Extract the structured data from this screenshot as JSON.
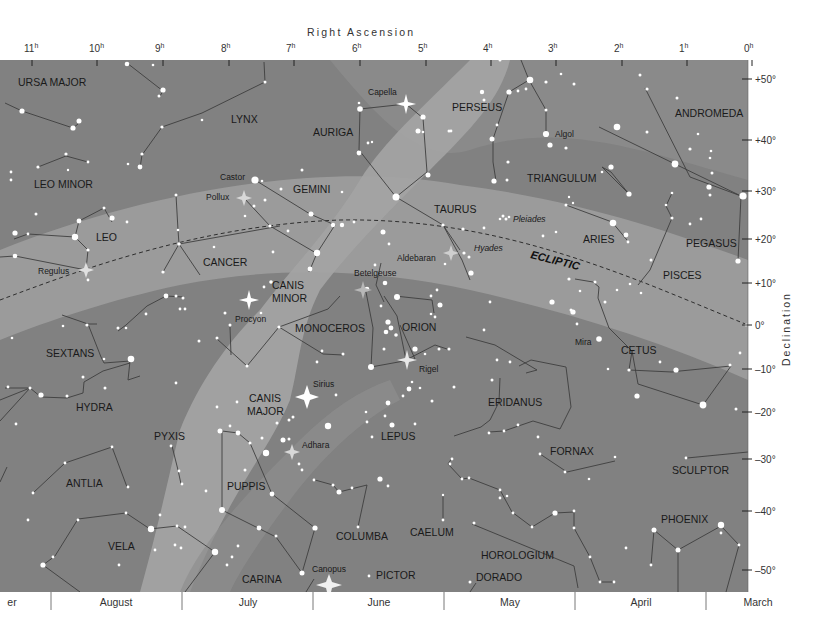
{
  "axes": {
    "ra_title": "Right Ascension",
    "dec_title": "Declination",
    "ra_ticks": [
      {
        "label": "11",
        "x": 32
      },
      {
        "label": "10",
        "x": 97
      },
      {
        "label": "9",
        "x": 163
      },
      {
        "label": "8",
        "x": 229
      },
      {
        "label": "7",
        "x": 294
      },
      {
        "label": "6",
        "x": 360
      },
      {
        "label": "5",
        "x": 426
      },
      {
        "label": "4",
        "x": 491
      },
      {
        "label": "3",
        "x": 556
      },
      {
        "label": "2",
        "x": 622
      },
      {
        "label": "1",
        "x": 687
      },
      {
        "label": "0",
        "x": 752
      }
    ],
    "ra_unit": "h",
    "dec_ticks": [
      {
        "label": "+50°",
        "y": 79
      },
      {
        "label": "+40°",
        "y": 140
      },
      {
        "label": "+30°",
        "y": 191
      },
      {
        "label": "+20°",
        "y": 239
      },
      {
        "label": "+10°",
        "y": 283
      },
      {
        "label": "0°",
        "y": 325
      },
      {
        "label": "–10°",
        "y": 369
      },
      {
        "label": "–20°",
        "y": 412
      },
      {
        "label": "–30°",
        "y": 459
      },
      {
        "label": "–40°",
        "y": 511
      },
      {
        "label": "–50°",
        "y": 570
      }
    ],
    "months": [
      {
        "label": "er",
        "x": 12
      },
      {
        "label": "August",
        "x": 116
      },
      {
        "label": "July",
        "x": 248
      },
      {
        "label": "June",
        "x": 379
      },
      {
        "label": "May",
        "x": 510
      },
      {
        "label": "April",
        "x": 641
      },
      {
        "label": "March",
        "x": 758
      }
    ],
    "month_dividers": [
      51,
      182,
      313,
      444,
      575,
      706
    ]
  },
  "ecliptic_label": "ECLIPTIC",
  "constellations": [
    {
      "name": "URSA MAJOR",
      "x": 18,
      "y": 86
    },
    {
      "name": "LYNX",
      "x": 231,
      "y": 123
    },
    {
      "name": "AURIGA",
      "x": 313,
      "y": 136
    },
    {
      "name": "PERSEUS",
      "x": 452,
      "y": 111
    },
    {
      "name": "ANDROMEDA",
      "x": 675,
      "y": 117
    },
    {
      "name": "LEO MINOR",
      "x": 34,
      "y": 188
    },
    {
      "name": "GEMINI",
      "x": 293,
      "y": 193
    },
    {
      "name": "TRIANGULUM",
      "x": 527,
      "y": 182
    },
    {
      "name": "TAURUS",
      "x": 434,
      "y": 213
    },
    {
      "name": "LEO",
      "x": 96,
      "y": 241
    },
    {
      "name": "CANCER",
      "x": 203,
      "y": 266
    },
    {
      "name": "ARIES",
      "x": 583,
      "y": 243
    },
    {
      "name": "PEGASUS",
      "x": 686,
      "y": 247
    },
    {
      "name": "PISCES",
      "x": 663,
      "y": 279
    },
    {
      "name": "CANIS",
      "x": 272,
      "y": 289
    },
    {
      "name": "MINOR",
      "x": 272,
      "y": 302
    },
    {
      "name": "MONOCEROS",
      "x": 295,
      "y": 332
    },
    {
      "name": "ORION",
      "x": 402,
      "y": 331
    },
    {
      "name": "CETUS",
      "x": 621,
      "y": 354
    },
    {
      "name": "SEXTANS",
      "x": 46,
      "y": 357
    },
    {
      "name": "HYDRA",
      "x": 76,
      "y": 411
    },
    {
      "name": "CANIS",
      "x": 249,
      "y": 402
    },
    {
      "name": "MAJOR",
      "x": 247,
      "y": 415
    },
    {
      "name": "ERIDANUS",
      "x": 488,
      "y": 406
    },
    {
      "name": "PYXIS",
      "x": 154,
      "y": 440
    },
    {
      "name": "LEPUS",
      "x": 381,
      "y": 440
    },
    {
      "name": "FORNAX",
      "x": 550,
      "y": 455
    },
    {
      "name": "SCULPTOR",
      "x": 672,
      "y": 474
    },
    {
      "name": "ANTLIA",
      "x": 66,
      "y": 487
    },
    {
      "name": "PUPPIS",
      "x": 227,
      "y": 490
    },
    {
      "name": "PHOENIX",
      "x": 661,
      "y": 523
    },
    {
      "name": "COLUMBA",
      "x": 336,
      "y": 540
    },
    {
      "name": "CAELUM",
      "x": 410,
      "y": 536
    },
    {
      "name": "VELA",
      "x": 108,
      "y": 550
    },
    {
      "name": "HOROLOGIUM",
      "x": 481,
      "y": 559
    },
    {
      "name": "PICTOR",
      "x": 376,
      "y": 579
    },
    {
      "name": "DORADO",
      "x": 476,
      "y": 581
    },
    {
      "name": "CARINA",
      "x": 242,
      "y": 583
    }
  ],
  "named_stars": [
    {
      "name": "Capella",
      "x": 406,
      "y": 104,
      "lx": 368,
      "ly": 95
    },
    {
      "name": "Algol",
      "x": 547,
      "y": 134,
      "lx": 555,
      "ly": 137
    },
    {
      "name": "Castor",
      "x": 255,
      "y": 180,
      "lx": 220,
      "ly": 180
    },
    {
      "name": "Pollux",
      "x": 244,
      "y": 198,
      "lx": 206,
      "ly": 200
    },
    {
      "name": "Pleiades",
      "x": 503,
      "y": 219,
      "lx": 513,
      "ly": 222
    },
    {
      "name": "Aldebaran",
      "x": 451,
      "y": 253,
      "lx": 397,
      "ly": 261
    },
    {
      "name": "Hyades",
      "x": 463,
      "y": 250,
      "lx": 474,
      "ly": 251
    },
    {
      "name": "Regulus",
      "x": 86,
      "y": 270,
      "lx": 38,
      "ly": 274
    },
    {
      "name": "Betelgeuse",
      "x": 363,
      "y": 290,
      "lx": 354,
      "ly": 276
    },
    {
      "name": "Procyon",
      "x": 249,
      "y": 300,
      "lx": 235,
      "ly": 322
    },
    {
      "name": "Mira",
      "x": 599,
      "y": 339,
      "lx": 575,
      "ly": 345
    },
    {
      "name": "Rigel",
      "x": 407,
      "y": 360,
      "lx": 419,
      "ly": 372
    },
    {
      "name": "Sirius",
      "x": 307,
      "y": 397,
      "lx": 313,
      "ly": 387
    },
    {
      "name": "Adhara",
      "x": 292,
      "y": 452,
      "lx": 302,
      "ly": 448
    },
    {
      "name": "Canopus",
      "x": 329,
      "y": 585,
      "lx": 312,
      "ly": 572
    }
  ],
  "colors": {
    "sky_dark": "#808080",
    "sky_mid": "#8f8f8f",
    "milky_way": "#a3a3a3",
    "zodiac_band": "#9d9d9d",
    "star": "#ffffff",
    "line": "#3e3e3e",
    "text": "#1a1a1a"
  }
}
